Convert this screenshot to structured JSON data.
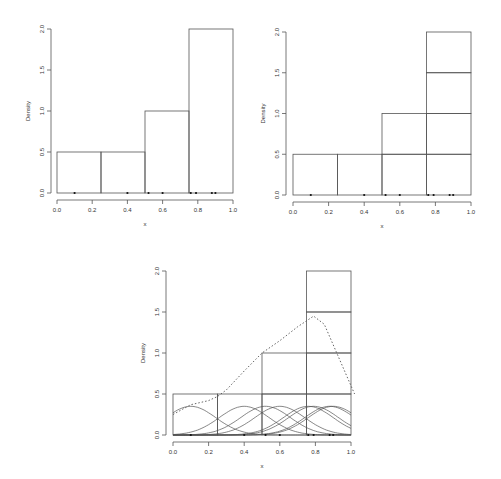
{
  "chart_data": [
    {
      "id": "histogram",
      "type": "bar",
      "title": "",
      "xlabel": "x",
      "ylabel": "Density",
      "xlim": [
        0,
        1
      ],
      "ylim": [
        0,
        2
      ],
      "grid": false,
      "x_ticks": [
        "0.0",
        "0.2",
        "0.4",
        "0.6",
        "0.8",
        "1.0"
      ],
      "y_ticks": [
        "0.0",
        "0.5",
        "1.0",
        "1.5",
        "2.0"
      ],
      "bins": [
        [
          0,
          0.25
        ],
        [
          0.25,
          0.5
        ],
        [
          0.5,
          0.75
        ],
        [
          0.75,
          1.0
        ]
      ],
      "categories": [
        "0-0.25",
        "0.25-0.5",
        "0.5-0.75",
        "0.75-1.0"
      ],
      "values": [
        0.5,
        0.5,
        1.0,
        2.0
      ],
      "data_points": [
        0.1,
        0.4,
        0.52,
        0.6,
        0.76,
        0.79,
        0.88,
        0.9
      ]
    },
    {
      "id": "stacked-blocks",
      "type": "bar",
      "title": "",
      "xlabel": "x",
      "ylabel": "Density",
      "xlim": [
        0,
        1
      ],
      "ylim": [
        0,
        2
      ],
      "grid": false,
      "x_ticks": [
        "0.0",
        "0.2",
        "0.4",
        "0.6",
        "0.8",
        "1.0"
      ],
      "y_ticks": [
        "0.0",
        "0.5",
        "1.0",
        "1.5",
        "2.0"
      ],
      "bins": [
        [
          0,
          0.25
        ],
        [
          0.25,
          0.5
        ],
        [
          0.5,
          0.75
        ],
        [
          0.75,
          1.0
        ]
      ],
      "categories": [
        "0-0.25",
        "0.25-0.5",
        "0.5-0.75",
        "0.75-1.0"
      ],
      "values": [
        0.5,
        0.5,
        1.0,
        2.0
      ],
      "block_height": 0.5,
      "annotation": "each observation drawn as a stacked block of height 0.5",
      "data_points": [
        0.1,
        0.4,
        0.52,
        0.6,
        0.76,
        0.79,
        0.88,
        0.9
      ]
    },
    {
      "id": "kernel-density",
      "type": "line",
      "title": "",
      "xlabel": "x",
      "ylabel": "Density",
      "xlim": [
        0,
        1
      ],
      "ylim": [
        0,
        2
      ],
      "grid": false,
      "x_ticks": [
        "0.0",
        "0.2",
        "0.4",
        "0.6",
        "0.8",
        "1.0"
      ],
      "y_ticks": [
        "0.0",
        "0.5",
        "1.0",
        "1.5",
        "2.0"
      ],
      "bins": [
        [
          0,
          0.25
        ],
        [
          0.25,
          0.5
        ],
        [
          0.5,
          0.75
        ],
        [
          0.75,
          1.0
        ]
      ],
      "values": [
        0.5,
        0.5,
        1.0,
        2.0
      ],
      "block_height": 0.5,
      "data_points": [
        0.1,
        0.4,
        0.52,
        0.6,
        0.76,
        0.79,
        0.88,
        0.9
      ],
      "kernel_bandwidth": 0.14,
      "kernel_peak": 0.35,
      "series": [
        {
          "name": "individual gaussian kernels",
          "style": "solid",
          "peak_each": 0.35
        },
        {
          "name": "kernel density estimate (sum)",
          "style": "dotted",
          "x": [
            0.0,
            0.1,
            0.2,
            0.25,
            0.3,
            0.4,
            0.5,
            0.6,
            0.7,
            0.79,
            0.85,
            0.9,
            1.0,
            1.02
          ],
          "y": [
            0.25,
            0.37,
            0.42,
            0.47,
            0.55,
            0.78,
            1.0,
            1.15,
            1.32,
            1.45,
            1.35,
            1.1,
            0.6,
            0.5
          ]
        }
      ]
    }
  ]
}
